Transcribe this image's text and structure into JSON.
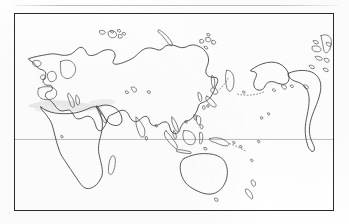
{
  "document": {
    "type": "map",
    "title": "Blank outline world map (Asia-Pacific centred)",
    "projection_note": "equirectangular, Pacific-centred",
    "background_color": "#fefefe",
    "ink_color": "#3b3b3b"
  },
  "top_rule": {
    "name": "page-rule",
    "color": "#bdbdbd"
  },
  "map": {
    "frame": {
      "border_color": "#2a2a2a",
      "fill_color": "#ffffff",
      "x": 14,
      "y": 13,
      "width": 320,
      "height": 198
    },
    "graticule": {
      "equator": {
        "label": "Equator",
        "color": "#b6b6b6",
        "y_fraction": 0.64
      }
    },
    "landmasses": [
      {
        "id": "eurasia",
        "label": "Eurasia"
      },
      {
        "id": "africa",
        "label": "Africa"
      },
      {
        "id": "arabia",
        "label": "Arabian Peninsula"
      },
      {
        "id": "india",
        "label": "Indian subcontinent"
      },
      {
        "id": "scandinavia",
        "label": "Scandinavia"
      },
      {
        "id": "british-isles",
        "label": "British Isles"
      },
      {
        "id": "iberia",
        "label": "Iberian Peninsula"
      },
      {
        "id": "iceland",
        "label": "Iceland"
      },
      {
        "id": "novaya-zemlya",
        "label": "Novaya Zemlya"
      },
      {
        "id": "svalbard",
        "label": "Svalbard"
      },
      {
        "id": "new-siberian-islands",
        "label": "New Siberian Islands"
      },
      {
        "id": "kamchatka",
        "label": "Kamchatka"
      },
      {
        "id": "sakhalin",
        "label": "Sakhalin"
      },
      {
        "id": "japan",
        "label": "Japan"
      },
      {
        "id": "korea",
        "label": "Korean Peninsula"
      },
      {
        "id": "taiwan",
        "label": "Taiwan"
      },
      {
        "id": "philippines",
        "label": "Philippines"
      },
      {
        "id": "borneo",
        "label": "Borneo"
      },
      {
        "id": "sumatra",
        "label": "Sumatra"
      },
      {
        "id": "java",
        "label": "Java"
      },
      {
        "id": "sulawesi",
        "label": "Sulawesi"
      },
      {
        "id": "new-guinea",
        "label": "New Guinea"
      },
      {
        "id": "australia",
        "label": "Australia"
      },
      {
        "id": "tasmania",
        "label": "Tasmania"
      },
      {
        "id": "new-zealand",
        "label": "New Zealand"
      },
      {
        "id": "madagascar",
        "label": "Madagascar"
      },
      {
        "id": "sri-lanka",
        "label": "Sri Lanka"
      },
      {
        "id": "alaska",
        "label": "Alaska"
      },
      {
        "id": "north-america-west",
        "label": "Western North America"
      },
      {
        "id": "aleutians",
        "label": "Aleutian Islands"
      },
      {
        "id": "hawaii",
        "label": "Hawaiian Islands"
      },
      {
        "id": "greenland-edge",
        "label": "Greenland (eastern edge)"
      },
      {
        "id": "fiji",
        "label": "Fiji / Melanesian chain"
      }
    ],
    "artifacts": [
      {
        "id": "north-africa-smudge",
        "label": "scan smudge over North Africa",
        "color": "#e8e8e8"
      },
      {
        "id": "levant-smudge",
        "label": "scan smudge over the Levant",
        "color": "#efefef"
      }
    ]
  }
}
